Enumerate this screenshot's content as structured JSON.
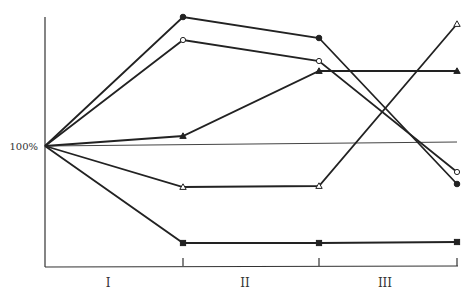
{
  "chart_data": {
    "type": "line",
    "title": "",
    "xlabel": "",
    "ylabel": "",
    "y_reference_label": "100%",
    "categories": [
      "start",
      "I",
      "II",
      "III"
    ],
    "x_tick_labels": [
      "I",
      "II",
      "III"
    ],
    "grid": false,
    "legend": null,
    "series": [
      {
        "name": "filled-circle",
        "marker": "circle-filled",
        "values": [
          100,
          198,
          182,
          72
        ]
      },
      {
        "name": "open-circle",
        "marker": "circle-open",
        "values": [
          100,
          181,
          165,
          81
        ]
      },
      {
        "name": "filled-triangle",
        "marker": "triangle-filled",
        "values": [
          100,
          107,
          157,
          157
        ]
      },
      {
        "name": "open-triangle",
        "marker": "triangle-open",
        "values": [
          100,
          69,
          70,
          191
        ]
      },
      {
        "name": "filled-square",
        "marker": "square-filled",
        "values": [
          100,
          27,
          27,
          28
        ]
      }
    ],
    "pixel_points": {
      "origin": [
        45,
        146
      ],
      "x": [
        45,
        183,
        319,
        457
      ],
      "filled-circle": [
        146,
        17,
        38,
        184
      ],
      "open-circle": [
        146,
        40,
        61,
        172
      ],
      "filled-triangle": [
        146,
        136,
        71,
        71
      ],
      "open-triangle": [
        146,
        187,
        186,
        24
      ],
      "filled-square": [
        146,
        243,
        243,
        242
      ]
    }
  }
}
